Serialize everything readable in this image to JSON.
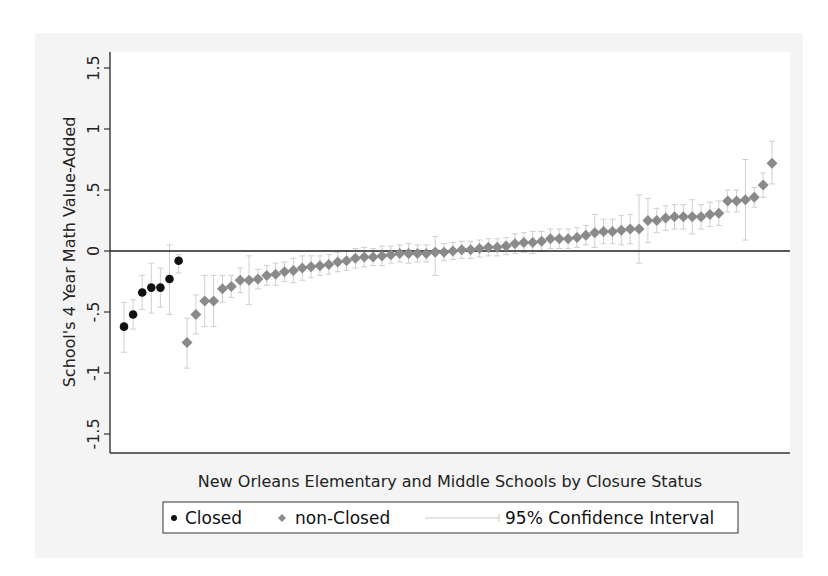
{
  "chart_data": {
    "type": "scatter",
    "title": "",
    "xlabel": "New Orleans Elementary and Middle Schools by Closure Status",
    "ylabel": "School's 4 Year Math Value-Added",
    "ylim": [
      -1.5,
      1.5
    ],
    "yticks": [
      {
        "value": -1.5,
        "label": "-1.5"
      },
      {
        "value": -1,
        "label": "-1"
      },
      {
        "value": -0.5,
        "label": "-.5"
      },
      {
        "value": 0,
        "label": "0"
      },
      {
        "value": 0.5,
        "label": ".5"
      },
      {
        "value": 1,
        "label": "1"
      },
      {
        "value": 1.5,
        "label": "1.5"
      }
    ],
    "reference_line": {
      "y": 0
    },
    "grid": false,
    "legend_position": "bottom",
    "legend": [
      {
        "label": "Closed",
        "marker": "circle",
        "color": "#111111"
      },
      {
        "label": "non-Closed",
        "marker": "diamond",
        "color": "#8a8a8a"
      },
      {
        "label": "95% Confidence Interval",
        "marker": "line",
        "color": "#c8c8c8"
      }
    ],
    "series": [
      {
        "name": "Closed",
        "color": "#111111",
        "marker": "circle",
        "points": [
          {
            "rank": 1,
            "value": -0.62,
            "ci_low": -0.83,
            "ci_high": -0.42
          },
          {
            "rank": 2,
            "value": -0.52,
            "ci_low": -0.64,
            "ci_high": -0.4
          },
          {
            "rank": 3,
            "value": -0.34,
            "ci_low": -0.48,
            "ci_high": -0.2
          },
          {
            "rank": 4,
            "value": -0.3,
            "ci_low": -0.51,
            "ci_high": -0.1
          },
          {
            "rank": 5,
            "value": -0.3,
            "ci_low": -0.46,
            "ci_high": -0.14
          },
          {
            "rank": 6,
            "value": -0.23,
            "ci_low": -0.52,
            "ci_high": 0.05
          },
          {
            "rank": 7,
            "value": -0.08,
            "ci_low": -0.18,
            "ci_high": -0.03
          }
        ]
      },
      {
        "name": "non-Closed",
        "color": "#8a8a8a",
        "marker": "diamond",
        "points": [
          {
            "rank": 1,
            "value": -0.75,
            "ci_low": -0.96,
            "ci_high": -0.55
          },
          {
            "rank": 2,
            "value": -0.52,
            "ci_low": -0.68,
            "ci_high": -0.36
          },
          {
            "rank": 3,
            "value": -0.41,
            "ci_low": -0.62,
            "ci_high": -0.2
          },
          {
            "rank": 4,
            "value": -0.41,
            "ci_low": -0.62,
            "ci_high": -0.2
          },
          {
            "rank": 5,
            "value": -0.31,
            "ci_low": -0.42,
            "ci_high": -0.2
          },
          {
            "rank": 6,
            "value": -0.29,
            "ci_low": -0.38,
            "ci_high": -0.2
          },
          {
            "rank": 7,
            "value": -0.24,
            "ci_low": -0.34,
            "ci_high": -0.14
          },
          {
            "rank": 8,
            "value": -0.24,
            "ci_low": -0.44,
            "ci_high": -0.04
          },
          {
            "rank": 9,
            "value": -0.23,
            "ci_low": -0.31,
            "ci_high": -0.15
          },
          {
            "rank": 10,
            "value": -0.2,
            "ci_low": -0.28,
            "ci_high": -0.12
          },
          {
            "rank": 11,
            "value": -0.19,
            "ci_low": -0.28,
            "ci_high": -0.1
          },
          {
            "rank": 12,
            "value": -0.17,
            "ci_low": -0.25,
            "ci_high": -0.09
          },
          {
            "rank": 13,
            "value": -0.16,
            "ci_low": -0.26,
            "ci_high": -0.06
          },
          {
            "rank": 14,
            "value": -0.14,
            "ci_low": -0.24,
            "ci_high": -0.04
          },
          {
            "rank": 15,
            "value": -0.13,
            "ci_low": -0.22,
            "ci_high": -0.04
          },
          {
            "rank": 16,
            "value": -0.12,
            "ci_low": -0.2,
            "ci_high": -0.04
          },
          {
            "rank": 17,
            "value": -0.11,
            "ci_low": -0.19,
            "ci_high": -0.03
          },
          {
            "rank": 18,
            "value": -0.09,
            "ci_low": -0.17,
            "ci_high": -0.01
          },
          {
            "rank": 19,
            "value": -0.08,
            "ci_low": -0.16,
            "ci_high": 0.0
          },
          {
            "rank": 20,
            "value": -0.06,
            "ci_low": -0.14,
            "ci_high": 0.02
          },
          {
            "rank": 21,
            "value": -0.05,
            "ci_low": -0.13,
            "ci_high": 0.03
          },
          {
            "rank": 22,
            "value": -0.05,
            "ci_low": -0.12,
            "ci_high": 0.02
          },
          {
            "rank": 23,
            "value": -0.04,
            "ci_low": -0.12,
            "ci_high": 0.04
          },
          {
            "rank": 24,
            "value": -0.03,
            "ci_low": -0.1,
            "ci_high": 0.04
          },
          {
            "rank": 25,
            "value": -0.02,
            "ci_low": -0.09,
            "ci_high": 0.05
          },
          {
            "rank": 26,
            "value": -0.02,
            "ci_low": -0.1,
            "ci_high": 0.06
          },
          {
            "rank": 27,
            "value": -0.02,
            "ci_low": -0.09,
            "ci_high": 0.05
          },
          {
            "rank": 28,
            "value": -0.02,
            "ci_low": -0.09,
            "ci_high": 0.05
          },
          {
            "rank": 29,
            "value": -0.01,
            "ci_low": -0.2,
            "ci_high": 0.12
          },
          {
            "rank": 30,
            "value": -0.01,
            "ci_low": -0.08,
            "ci_high": 0.06
          },
          {
            "rank": 31,
            "value": 0.0,
            "ci_low": -0.07,
            "ci_high": 0.07
          },
          {
            "rank": 32,
            "value": 0.01,
            "ci_low": -0.06,
            "ci_high": 0.08
          },
          {
            "rank": 33,
            "value": 0.01,
            "ci_low": -0.06,
            "ci_high": 0.08
          },
          {
            "rank": 34,
            "value": 0.02,
            "ci_low": -0.05,
            "ci_high": 0.09
          },
          {
            "rank": 35,
            "value": 0.03,
            "ci_low": -0.04,
            "ci_high": 0.1
          },
          {
            "rank": 36,
            "value": 0.03,
            "ci_low": -0.04,
            "ci_high": 0.1
          },
          {
            "rank": 37,
            "value": 0.04,
            "ci_low": -0.03,
            "ci_high": 0.11
          },
          {
            "rank": 38,
            "value": 0.06,
            "ci_low": -0.02,
            "ci_high": 0.14
          },
          {
            "rank": 39,
            "value": 0.07,
            "ci_low": -0.01,
            "ci_high": 0.15
          },
          {
            "rank": 40,
            "value": 0.07,
            "ci_low": -0.02,
            "ci_high": 0.16
          },
          {
            "rank": 41,
            "value": 0.08,
            "ci_low": 0.0,
            "ci_high": 0.16
          },
          {
            "rank": 42,
            "value": 0.1,
            "ci_low": 0.02,
            "ci_high": 0.18
          },
          {
            "rank": 43,
            "value": 0.1,
            "ci_low": 0.02,
            "ci_high": 0.18
          },
          {
            "rank": 44,
            "value": 0.1,
            "ci_low": 0.02,
            "ci_high": 0.18
          },
          {
            "rank": 45,
            "value": 0.11,
            "ci_low": 0.03,
            "ci_high": 0.19
          },
          {
            "rank": 46,
            "value": 0.13,
            "ci_low": 0.05,
            "ci_high": 0.21
          },
          {
            "rank": 47,
            "value": 0.15,
            "ci_low": 0.03,
            "ci_high": 0.3
          },
          {
            "rank": 48,
            "value": 0.16,
            "ci_low": 0.06,
            "ci_high": 0.26
          },
          {
            "rank": 49,
            "value": 0.16,
            "ci_low": 0.06,
            "ci_high": 0.26
          },
          {
            "rank": 50,
            "value": 0.17,
            "ci_low": 0.05,
            "ci_high": 0.29
          },
          {
            "rank": 51,
            "value": 0.18,
            "ci_low": 0.06,
            "ci_high": 0.3
          },
          {
            "rank": 52,
            "value": 0.18,
            "ci_low": -0.1,
            "ci_high": 0.46
          },
          {
            "rank": 53,
            "value": 0.25,
            "ci_low": 0.07,
            "ci_high": 0.43
          },
          {
            "rank": 54,
            "value": 0.25,
            "ci_low": 0.15,
            "ci_high": 0.35
          },
          {
            "rank": 55,
            "value": 0.27,
            "ci_low": 0.17,
            "ci_high": 0.37
          },
          {
            "rank": 56,
            "value": 0.28,
            "ci_low": 0.18,
            "ci_high": 0.38
          },
          {
            "rank": 57,
            "value": 0.28,
            "ci_low": 0.18,
            "ci_high": 0.38
          },
          {
            "rank": 58,
            "value": 0.28,
            "ci_low": 0.14,
            "ci_high": 0.42
          },
          {
            "rank": 59,
            "value": 0.28,
            "ci_low": 0.18,
            "ci_high": 0.38
          },
          {
            "rank": 60,
            "value": 0.3,
            "ci_low": 0.2,
            "ci_high": 0.4
          },
          {
            "rank": 61,
            "value": 0.31,
            "ci_low": 0.21,
            "ci_high": 0.41
          },
          {
            "rank": 62,
            "value": 0.41,
            "ci_low": 0.32,
            "ci_high": 0.5
          },
          {
            "rank": 63,
            "value": 0.41,
            "ci_low": 0.32,
            "ci_high": 0.5
          },
          {
            "rank": 64,
            "value": 0.42,
            "ci_low": 0.09,
            "ci_high": 0.75
          },
          {
            "rank": 65,
            "value": 0.44,
            "ci_low": 0.36,
            "ci_high": 0.52
          },
          {
            "rank": 66,
            "value": 0.54,
            "ci_low": 0.44,
            "ci_high": 0.64
          },
          {
            "rank": 67,
            "value": 0.72,
            "ci_low": 0.55,
            "ci_high": 0.9
          }
        ]
      }
    ]
  },
  "axes": {
    "ylabel": "School's 4 Year Math Value-Added",
    "xlabel": "New Orleans Elementary and Middle Schools by Closure Status"
  },
  "legend": {
    "closed_label": "Closed",
    "nonclosed_label": "non-Closed",
    "ci_label": "95% Confidence Interval"
  }
}
